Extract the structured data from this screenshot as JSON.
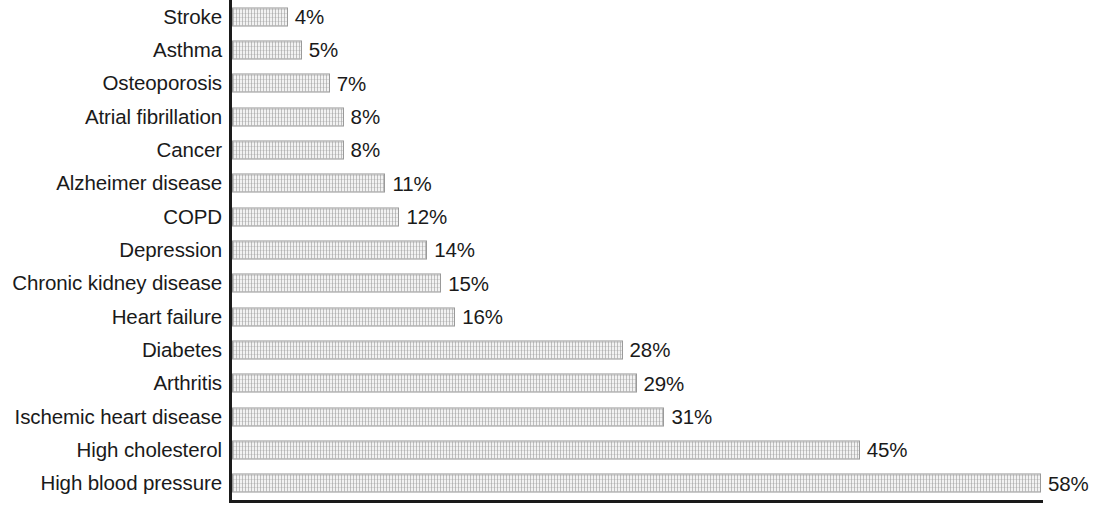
{
  "chart_data": {
    "type": "bar",
    "orientation": "horizontal",
    "title": "",
    "subtitle": "",
    "xlabel": "",
    "ylabel": "",
    "grid": false,
    "legend": null,
    "value_suffix": "%",
    "xlim": [
      0,
      58
    ],
    "axis_color": "#1a1a1a",
    "bar_fill": "#f2f2f2",
    "bar_border": "#9a9a9a",
    "categories": [
      "Stroke",
      "Asthma",
      "Osteoporosis",
      "Atrial fibrillation",
      "Cancer",
      "Alzheimer disease",
      "COPD",
      "Depression",
      "Chronic kidney disease",
      "Heart failure",
      "Diabetes",
      "Arthritis",
      "Ischemic heart disease",
      "High cholesterol",
      "High blood pressure"
    ],
    "values": [
      4,
      5,
      7,
      8,
      8,
      11,
      12,
      14,
      15,
      16,
      28,
      29,
      31,
      45,
      58
    ],
    "value_labels": [
      "4%",
      "5%",
      "7%",
      "8%",
      "8%",
      "11%",
      "12%",
      "14%",
      "15%",
      "16%",
      "28%",
      "29%",
      "31%",
      "45%",
      "58%"
    ]
  }
}
